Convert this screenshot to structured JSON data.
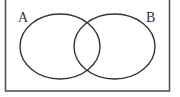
{
  "diagram": {
    "type": "venn",
    "sets": [
      {
        "id": "A",
        "label": "A"
      },
      {
        "id": "B",
        "label": "B"
      }
    ],
    "colors": {
      "stroke": "#333333",
      "frame": "#555555",
      "background": "#ffffff"
    }
  }
}
